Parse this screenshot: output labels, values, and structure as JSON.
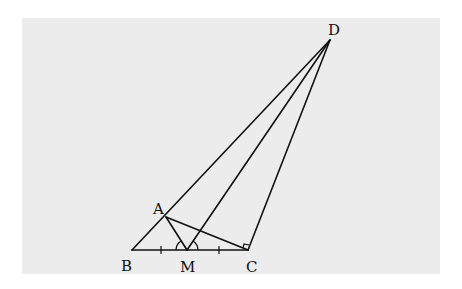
{
  "diagram": {
    "type": "geometry",
    "background": "#ececec",
    "stroke": "#111111",
    "points": {
      "A": {
        "label": "A",
        "x": 166,
        "y": 217
      },
      "B": {
        "label": "B",
        "x": 132,
        "y": 250
      },
      "M": {
        "label": "M",
        "x": 187,
        "y": 250
      },
      "C": {
        "label": "C",
        "x": 248,
        "y": 250
      },
      "D": {
        "label": "D",
        "x": 330,
        "y": 40
      }
    },
    "segments": [
      "BC",
      "BD",
      "AM",
      "AC",
      "MD",
      "CD"
    ],
    "marks": {
      "equal_ticks": [
        "BM",
        "MC"
      ],
      "equal_angles_at": "M",
      "right_angle_at": "C"
    }
  }
}
